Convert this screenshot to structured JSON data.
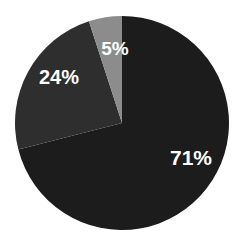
{
  "chart_data": {
    "type": "pie",
    "title": "",
    "categories": [
      "Slice A",
      "Slice B",
      "Slice C"
    ],
    "values": [
      71,
      24,
      5
    ],
    "labels": [
      "71%",
      "24%",
      "5%"
    ],
    "colors": [
      "#1c1c1c",
      "#2e2e2e",
      "#8c8c8c"
    ],
    "start_angle": "12 o'clock",
    "direction": "clockwise",
    "legend": "none"
  },
  "slices": [
    {
      "label": "71%",
      "value": 71,
      "color": "#1c1c1c"
    },
    {
      "label": "24%",
      "value": 24,
      "color": "#2e2e2e"
    },
    {
      "label": "5%",
      "value": 5,
      "color": "#8c8c8c"
    }
  ]
}
